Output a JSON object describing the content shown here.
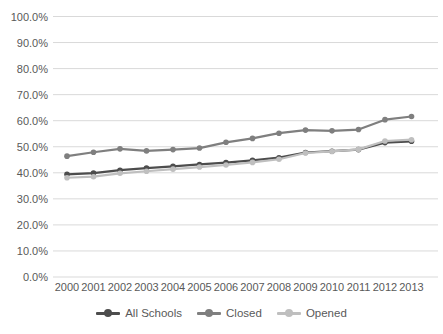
{
  "chart_data": {
    "type": "line",
    "title": "",
    "xlabel": "",
    "ylabel": "",
    "categories": [
      "2000",
      "2001",
      "2002",
      "2003",
      "2004",
      "2005",
      "2006",
      "2007",
      "2008",
      "2009",
      "2010",
      "2011",
      "2012",
      "2013"
    ],
    "series": [
      {
        "name": "All Schools",
        "color": "#4d4d4d",
        "values": [
          39.4,
          39.9,
          41.0,
          41.8,
          42.5,
          43.2,
          43.9,
          44.8,
          45.8,
          47.8,
          48.3,
          48.9,
          51.6,
          52.1
        ]
      },
      {
        "name": "Closed",
        "color": "#7f7f7f",
        "values": [
          46.4,
          47.9,
          49.2,
          48.4,
          48.9,
          49.5,
          51.7,
          53.2,
          55.2,
          56.4,
          56.1,
          56.6,
          60.4,
          61.6
        ]
      },
      {
        "name": "Opened",
        "color": "#bfbfbf",
        "values": [
          38.1,
          38.5,
          39.8,
          40.6,
          41.4,
          42.2,
          43.0,
          44.0,
          45.2,
          47.6,
          48.2,
          49.0,
          52.2,
          52.7
        ]
      }
    ],
    "ylim": [
      0,
      100
    ],
    "ytick_step": 10,
    "ytick_labels": [
      "0.0%",
      "10.0%",
      "20.0%",
      "30.0%",
      "40.0%",
      "50.0%",
      "60.0%",
      "70.0%",
      "80.0%",
      "90.0%",
      "100.0%"
    ],
    "grid": "horizontal",
    "legend_position": "bottom",
    "colors": {
      "background": "#ffffff",
      "grid_line": "#d9d9d9",
      "axis_text": "#595959"
    }
  }
}
